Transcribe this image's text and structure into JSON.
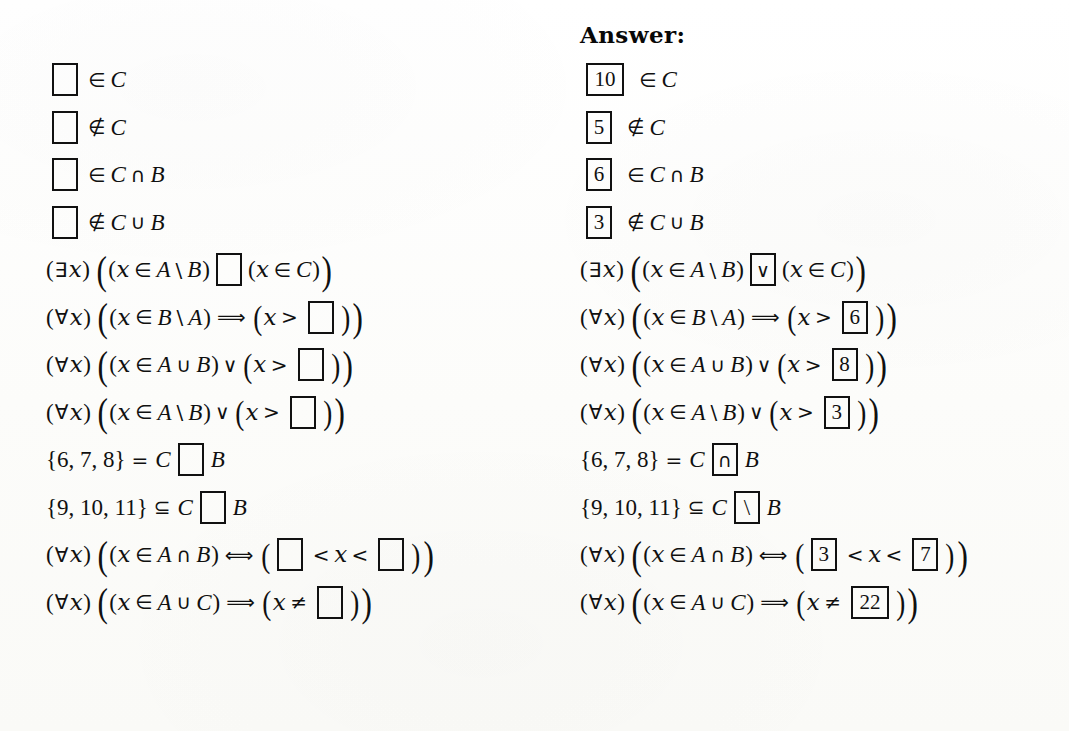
{
  "page": {
    "background_color": "#fdfdfc",
    "ink_color": "#101010",
    "answer_heading": "Answer:"
  },
  "icons": {
    "empty_box": "empty-answer-box"
  },
  "rows": [
    {
      "id": "row-1",
      "blank_count": 1,
      "prefix": "",
      "segments": [
        "",
        "∈ C"
      ],
      "question_text": "□ ∈ C",
      "answer_text": "10 ∈ C",
      "answers": [
        "10"
      ],
      "relation": "∈",
      "rhs": "C"
    },
    {
      "id": "row-2",
      "blank_count": 1,
      "question_text": "□ ∉ C",
      "answer_text": "5 ∉ C",
      "answers": [
        "5"
      ],
      "relation": "∉",
      "rhs": "C"
    },
    {
      "id": "row-3",
      "blank_count": 1,
      "question_text": "□ ∈ C ∩ B",
      "answer_text": "6 ∈ C ∩ B",
      "answers": [
        "6"
      ],
      "relation": "∈",
      "rhs": "C ∩ B"
    },
    {
      "id": "row-4",
      "blank_count": 1,
      "question_text": "□ ∉ C ∪ B",
      "answer_text": "3 ∉ C ∪ B",
      "answers": [
        "3"
      ],
      "relation": "∉",
      "rhs": "C ∪ B"
    },
    {
      "id": "row-5",
      "blank_count": 1,
      "question_text": "(∃x)((x ∈ A \\ B) □ (x ∈ C))",
      "answer_text": "(∃x)((x ∈ A \\ B) ∨ (x ∈ C))",
      "answers": [
        "∨"
      ],
      "quantifier": "∃"
    },
    {
      "id": "row-6",
      "blank_count": 1,
      "question_text": "(∀x)((x ∈ B \\ A) ⟹ (x > □))",
      "answer_text": "(∀x)((x ∈ B \\ A) ⟹ (x > 6))",
      "answers": [
        "6"
      ],
      "quantifier": "∀"
    },
    {
      "id": "row-7",
      "blank_count": 1,
      "question_text": "(∀x)((x ∈ A ∪ B) ∨ (x > □))",
      "answer_text": "(∀x)((x ∈ A ∪ B) ∨ (x > 8))",
      "answers": [
        "8"
      ],
      "quantifier": "∀"
    },
    {
      "id": "row-8",
      "blank_count": 1,
      "question_text": "(∀x)((x ∈ A \\ B) ∨ (x > □))",
      "answer_text": "(∀x)((x ∈ A \\ B) ∨ (x > 3))",
      "answers": [
        "3"
      ],
      "quantifier": "∀"
    },
    {
      "id": "row-9",
      "blank_count": 1,
      "question_text": "{6, 7, 8} = C □ B",
      "answer_text": "{6, 7, 8} = C ∩ B",
      "answers": [
        "∩"
      ],
      "lhs_set": "{6, 7, 8}"
    },
    {
      "id": "row-10",
      "blank_count": 1,
      "question_text": "{9, 10, 11} ⊆ C □ B",
      "answer_text": "{9, 10, 11} ⊆ C \\ B",
      "answers": [
        "\\"
      ],
      "lhs_set": "{9, 10, 11}"
    },
    {
      "id": "row-11",
      "blank_count": 2,
      "question_text": "(∀x)((x ∈ A ∩ B) ⟺ (□ < x < □))",
      "answer_text": "(∀x)((x ∈ A ∩ B) ⟺ (3 < x < 7))",
      "answers": [
        "3",
        "7"
      ],
      "quantifier": "∀"
    },
    {
      "id": "row-12",
      "blank_count": 1,
      "question_text": "(∀x)((x ∈ A ∪ C) ⟹ (x ≠ □))",
      "answer_text": "(∀x)((x ∈ A ∪ C) ⟹ (x ≠ 22))",
      "answers": [
        "22"
      ],
      "quantifier": "∀"
    }
  ],
  "symbols": {
    "exists": "∃",
    "forall": "∀",
    "element_of": "∈",
    "not_element_of": "∉",
    "intersection": "∩",
    "union": "∪",
    "setminus": "\\",
    "subset_eq": "⊆",
    "logical_or": "∨",
    "implies": "⟹",
    "iff": "⟺",
    "equals": "=",
    "less_than": "<",
    "greater_than": ">",
    "not_equal": "≠",
    "var_x": "x",
    "set_A": "A",
    "set_B": "B",
    "set_C": "C"
  },
  "sets": {
    "row9": "{6, 7, 8}",
    "row10": "{9, 10, 11}"
  }
}
